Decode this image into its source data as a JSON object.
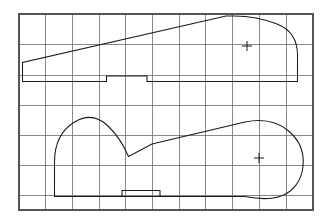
{
  "document": {
    "kind": "technical-line-drawing",
    "title": "",
    "description": "Two closed profile outlines plotted on a rectangular grid, each with a small cross-shaped centroid mark"
  },
  "grid": {
    "label": "background-grid",
    "line_color": "#6b6b6b",
    "border_color": "#555555",
    "background_color": "#ffffff",
    "x_start": 19,
    "y_start": 14,
    "x_end": 313,
    "y_end": 210,
    "column_count": 11,
    "row_count": 7,
    "column_width": 26.7,
    "row_height": 30.2,
    "vertical_lines": [
      19,
      45.7,
      72.4,
      99.1,
      125.8,
      152.5,
      179.2,
      205.9,
      232.6,
      259.3,
      286,
      313
    ],
    "horizontal_lines": [
      14,
      44.7,
      75.3,
      105.3,
      135.3,
      165.3,
      195.3,
      210
    ]
  },
  "shapes": {
    "stroke_color": "#1a1a1a",
    "upper_profile": {
      "label": "upper-profile-outline",
      "path": "M 22.5 62.5 L 22.5 81.5 L 106.5 81.5 L 106.5 76.0 L 147.0 76.0 L 147.0 81.5 L 297.5 81.5 L 297.5 55.0 C 297.5 41.0 291.0 29.5 277.0 24.0 C 263.0 18.5 248.0 16.0 234.0 16.0 L 226.0 16.0 Z",
      "leading_edge_note": "long straight sweep from lower-left corner up to the upper-right crest"
    },
    "lower_profile": {
      "label": "lower-profile-outline",
      "path": "M 54.5 196.5 L 54.5 162.0 C 54.5 144.0 61.5 130.0 74.5 122.0 C 87.5 114.0 99.0 117.5 108.0 126.0 C 117.0 134.5 124.0 146.0 128.5 156.5 L 152.0 144.0 L 245.0 122.0 C 262.0 118.5 277.0 121.5 288.0 130.5 C 299.0 139.5 304.5 152.5 303.0 166.5 C 301.5 180.5 293.5 191.5 281.0 196.0 C 268.5 200.5 255.0 198.5 245.0 196.5 L 122.0 196.5 L 122.0 190.5 L 160.0 190.5 L 160.0 196.5 Z",
      "leading_edge_note": "long straight chord running from the mid-left cusp up to the right lobe"
    },
    "center_marks": [
      {
        "label": "upper-centroid-mark",
        "x": 247,
        "y": 46,
        "arm_length": 5
      },
      {
        "label": "lower-centroid-mark",
        "x": 259,
        "y": 158,
        "arm_length": 5
      }
    ]
  }
}
